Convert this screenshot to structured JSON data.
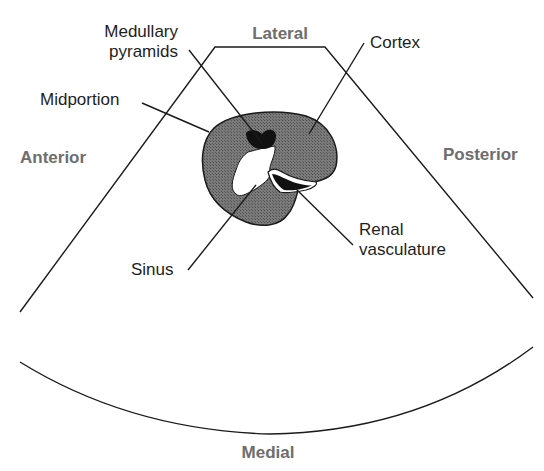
{
  "diagram": {
    "orientation": {
      "top": "Lateral",
      "bottom": "Medial",
      "left": "Anterior",
      "right": "Posterior"
    },
    "labels": {
      "medullary_pyramids_line1": "Medullary",
      "medullary_pyramids_line2": "pyramids",
      "cortex": "Cortex",
      "midportion": "Midportion",
      "sinus": "Sinus",
      "renal_vasculature_line1": "Renal",
      "renal_vasculature_line2": "vasculature"
    },
    "colors": {
      "cortex_fill": "#6f6f6f",
      "pyramid_fill": "#111111",
      "sinus_fill": "#ffffff",
      "line": "#1a1a1a",
      "orientation_text": "#6e6e6e"
    }
  }
}
